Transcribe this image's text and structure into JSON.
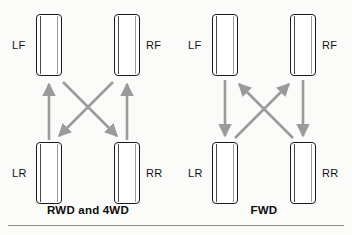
{
  "page": {
    "background_color": "#fbfbfa",
    "footer_rule_color": "#8e8e8e"
  },
  "colors": {
    "tire_outline": "#1b1b1b",
    "tire_fill": "#ffffff",
    "arrow": "#9b9b9b",
    "label_text": "#111111",
    "caption_text": "#0d0d0d"
  },
  "diagrams": [
    {
      "id": "rwd",
      "caption": "RWD and 4WD",
      "wheels": [
        {
          "id": "lf",
          "label": "LF",
          "position": "front-left"
        },
        {
          "id": "rf",
          "label": "RF",
          "position": "front-right"
        },
        {
          "id": "lr",
          "label": "LR",
          "position": "rear-left"
        },
        {
          "id": "rr",
          "label": "RR",
          "position": "rear-right"
        }
      ],
      "arrows": [
        {
          "name": "lr-to-lf",
          "from": "LR",
          "to": "LF",
          "kind": "straight",
          "direction": "up"
        },
        {
          "name": "rr-to-rf",
          "from": "RR",
          "to": "RF",
          "kind": "straight",
          "direction": "up"
        },
        {
          "name": "lf-to-rr",
          "from": "LF",
          "to": "RR",
          "kind": "diagonal",
          "direction": "down-right"
        },
        {
          "name": "rf-to-lr",
          "from": "RF",
          "to": "LR",
          "kind": "diagonal",
          "direction": "down-left"
        }
      ]
    },
    {
      "id": "fwd",
      "caption": "FWD",
      "wheels": [
        {
          "id": "lf",
          "label": "LF",
          "position": "front-left"
        },
        {
          "id": "rf",
          "label": "RF",
          "position": "front-right"
        },
        {
          "id": "lr",
          "label": "LR",
          "position": "rear-left"
        },
        {
          "id": "rr",
          "label": "RR",
          "position": "rear-right"
        }
      ],
      "arrows": [
        {
          "name": "lf-to-lr",
          "from": "LF",
          "to": "LR",
          "kind": "straight",
          "direction": "down"
        },
        {
          "name": "rf-to-rr",
          "from": "RF",
          "to": "RR",
          "kind": "straight",
          "direction": "down"
        },
        {
          "name": "lr-to-rf",
          "from": "LR",
          "to": "RF",
          "kind": "diagonal",
          "direction": "up-right"
        },
        {
          "name": "rr-to-lf",
          "from": "RR",
          "to": "LF",
          "kind": "diagonal",
          "direction": "up-left"
        }
      ]
    }
  ]
}
